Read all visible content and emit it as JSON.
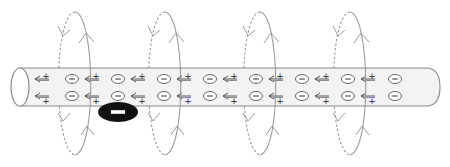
{
  "diagram": {
    "wire": {
      "fill": "#f3f3f3",
      "stroke": "#8a8a8a",
      "x_start": 20,
      "x_end": 440,
      "y_top": 68,
      "y_bottom": 106
    },
    "charges": {
      "electron_symbol": "−",
      "positive_symbol": "+",
      "electron_columns_x": [
        72,
        118,
        164,
        210,
        256,
        302,
        348,
        395
      ],
      "positive_columns_x": [
        44,
        94,
        140,
        186,
        232,
        278,
        324,
        370
      ],
      "row_top_y": 79,
      "row_bottom_y": 96
    },
    "field_loops": {
      "color": "#9a9a9a",
      "centers_x": [
        75,
        165,
        260,
        350
      ]
    },
    "free_electron": {
      "label": "−",
      "fill": "#111111",
      "cx": 118,
      "cy": 112
    }
  }
}
